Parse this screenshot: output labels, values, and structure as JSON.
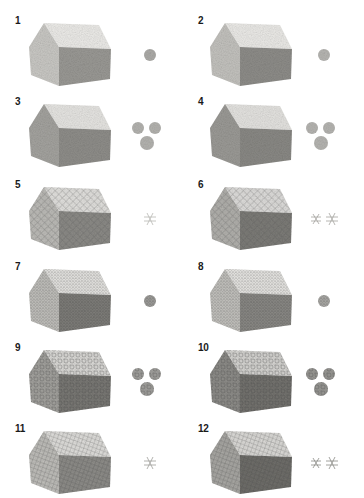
{
  "figure": {
    "items": [
      {
        "number": "1",
        "technique": "smooth-tone",
        "roof": "#ecebe8",
        "gable": "#c9c8c4",
        "wall": "#9a9995",
        "swatches": 1,
        "swatch_tone": "#9d9c98"
      },
      {
        "number": "2",
        "technique": "blended-tone",
        "roof": "#ebeae7",
        "gable": "#c3c2be",
        "wall": "#8e8d89",
        "swatches": 1,
        "swatch_tone": "#a9a8a4"
      },
      {
        "number": "3",
        "technique": "scumble-light",
        "roof": "#e6e5e2",
        "gable": "#a4a39f",
        "wall": "#8f8e8a",
        "swatches": 3,
        "swatch_tone": "#a6a5a1"
      },
      {
        "number": "4",
        "technique": "scumble-dark",
        "roof": "#e4e3e0",
        "gable": "#9b9a96",
        "wall": "#8a8985",
        "swatches": 3,
        "swatch_tone": "#a8a7a3"
      },
      {
        "number": "5",
        "technique": "crosshatch-open",
        "roof": "#e2e1de",
        "gable": "#bdbcb8",
        "wall": "#8c8b87",
        "swatches": 1,
        "swatch_tone": "#b8b7b3"
      },
      {
        "number": "6",
        "technique": "crosshatch-layered",
        "roof": "#dedddb",
        "gable": "#b2b1ad",
        "wall": "#7d7c78",
        "swatches": 2,
        "swatch_tone": "#a4a39f"
      },
      {
        "number": "7",
        "technique": "stipple",
        "roof": "#e6e5e2",
        "gable": "#c2c1bd",
        "wall": "#7f7e7a",
        "swatches": 1,
        "swatch_tone": "#8c8b87"
      },
      {
        "number": "8",
        "technique": "stipple-soft",
        "roof": "#e8e7e4",
        "gable": "#c4c3bf",
        "wall": "#8b8a86",
        "swatches": 1,
        "swatch_tone": "#9a9995"
      },
      {
        "number": "9",
        "technique": "circular-scribble",
        "roof": "#dad9d6",
        "gable": "#a3a29e",
        "wall": "#7a7975",
        "swatches": 3,
        "swatch_tone": "#8f8e8a"
      },
      {
        "number": "10",
        "technique": "circular-scribble-dark",
        "roof": "#d5d4d1",
        "gable": "#8e8d89",
        "wall": "#74736f",
        "swatches": 3,
        "swatch_tone": "#858480"
      },
      {
        "number": "11",
        "technique": "grid-hatch",
        "roof": "#e0dfdc",
        "gable": "#c0bfbb",
        "wall": "#8e8d89",
        "swatches": 1,
        "swatch_tone": "#9f9e9a"
      },
      {
        "number": "12",
        "technique": "grid-hatch-dense",
        "roof": "#dcdbd8",
        "gable": "#a9a8a4",
        "wall": "#6f6e6a",
        "swatches": 2,
        "swatch_tone": "#8c8b87"
      }
    ]
  }
}
